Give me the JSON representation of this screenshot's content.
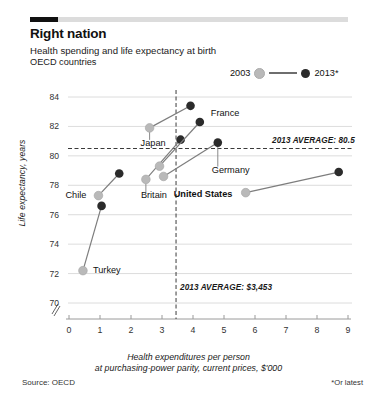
{
  "header": {
    "title": "Right nation",
    "subtitle": "Health spending and life expectancy at birth",
    "subtitle2": "OECD countries"
  },
  "legend": {
    "left_label": "2003",
    "right_label": "2013*",
    "color_2003": "#b9b9b9",
    "color_2013": "#2b2b2b",
    "connector_color": "#6e6e6e"
  },
  "footer": {
    "source": "Source: OECD",
    "footnote": "*Or latest"
  },
  "annotations": {
    "avg_life": "2013 AVERAGE: 80.5",
    "avg_spend": "2013 AVERAGE: $3,453"
  },
  "chart_data": {
    "type": "scatter",
    "title": "Right nation",
    "subtitle": "Health spending and life expectancy at birth",
    "xlabel": "Health expenditures per person at purchasing-power parity, current prices, $'000",
    "ylabel": "Life expectancy, years",
    "xlim": [
      0,
      9
    ],
    "ylim": [
      70,
      84
    ],
    "xticks": [
      "0",
      "1",
      "2",
      "3",
      "4",
      "5",
      "6",
      "7",
      "8",
      "9"
    ],
    "yticks": [
      "70",
      "72",
      "74",
      "76",
      "78",
      "80",
      "82",
      "84"
    ],
    "y_axis_break": true,
    "grid": "horizontal",
    "legend_position": "top-right",
    "reference_lines": [
      {
        "axis": "y",
        "value": 80.5,
        "label": "2013 AVERAGE: 80.5",
        "style": "dashed"
      },
      {
        "axis": "x",
        "value": 3.453,
        "label": "2013 AVERAGE: $3,453",
        "style": "dashed"
      }
    ],
    "series": [
      {
        "name": "2003",
        "color": "#b9b9b9",
        "marker": "circle"
      },
      {
        "name": "2013*",
        "color": "#2b2b2b",
        "marker": "circle"
      }
    ],
    "points": [
      {
        "country": "Turkey",
        "label_pos": "right",
        "x_2003": 0.45,
        "y_2003": 72.2,
        "x_2013": 1.05,
        "y_2013": 76.6
      },
      {
        "country": "Chile",
        "label_pos": "left",
        "x_2003": 0.95,
        "y_2003": 77.3,
        "x_2013": 1.62,
        "y_2013": 78.8
      },
      {
        "country": "Britain",
        "label_pos": "below",
        "x_2003": 2.48,
        "y_2003": 78.4,
        "x_2013": 3.6,
        "y_2013": 81.1
      },
      {
        "country": "Japan",
        "label_pos": "below",
        "x_2003": 2.6,
        "y_2003": 81.9,
        "x_2013": 3.92,
        "y_2013": 83.4
      },
      {
        "country": "France",
        "label_pos": "right",
        "x_2003": 2.92,
        "y_2003": 79.3,
        "x_2013": 4.22,
        "y_2013": 82.3
      },
      {
        "country": "Germany",
        "label_pos": "below",
        "x_2003": 3.05,
        "y_2003": 78.6,
        "x_2013": 4.8,
        "y_2013": 80.9
      },
      {
        "country": "United States",
        "label_pos": "left",
        "x_2003": 5.7,
        "y_2003": 77.5,
        "x_2013": 8.7,
        "y_2013": 78.9
      }
    ]
  }
}
